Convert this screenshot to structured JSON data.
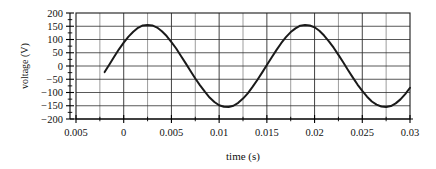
{
  "chart_data": {
    "type": "line",
    "title": "",
    "xlabel": "time (s)",
    "ylabel": "voltage (V)",
    "xlim": [
      -0.005,
      0.03
    ],
    "ylim": [
      -200,
      200
    ],
    "grid": true,
    "legend": "none",
    "line_color": "#1a1a1a",
    "grid_color": "#333333",
    "minor_grid_color": "#555555",
    "axis_color": "#000000",
    "background_color": "#ffffff",
    "xticks": [
      -0.005,
      0,
      0.005,
      0.01,
      0.015,
      0.02,
      0.025,
      0.03
    ],
    "xtick_labels": [
      "0.005",
      "0",
      "0.005",
      "0.01",
      "0.015",
      "0.02",
      "0.025",
      "0.03"
    ],
    "x_minor_step": 0.0025,
    "yticks": [
      -200,
      -150,
      -100,
      -50,
      0,
      50,
      100,
      150,
      200
    ],
    "ytick_labels": [
      "−200",
      "−150",
      "−100",
      "−50",
      "0",
      "50",
      "100",
      "150",
      "200"
    ],
    "y_minor_step": 25,
    "series": [
      {
        "name": "voltage",
        "form": "sine",
        "amplitude": 155,
        "period": 0.0165,
        "phase_zero_rising": -0.0016,
        "x_start": -0.002,
        "x_end": 0.03,
        "x": [
          -0.002,
          -0.0015,
          -0.001,
          -0.0005,
          0.0,
          0.0005,
          0.001,
          0.0015,
          0.002,
          0.0025,
          0.003,
          0.0035,
          0.004,
          0.0045,
          0.005,
          0.0055,
          0.006,
          0.0065,
          0.007,
          0.0075,
          0.008,
          0.0085,
          0.009,
          0.0095,
          0.01,
          0.0105,
          0.011,
          0.0115,
          0.012,
          0.0125,
          0.013,
          0.0135,
          0.014,
          0.0145,
          0.015,
          0.0155,
          0.016,
          0.0165,
          0.017,
          0.0175,
          0.018,
          0.0185,
          0.019,
          0.0195,
          0.02,
          0.0205,
          0.021,
          0.0215,
          0.022,
          0.0225,
          0.023,
          0.0235,
          0.024,
          0.0245,
          0.025,
          0.0255,
          0.026,
          0.0265,
          0.027,
          0.0275,
          0.028,
          0.0285,
          0.029,
          0.0295,
          0.03
        ],
        "y": [
          -23,
          6,
          35,
          63,
          88,
          111,
          129,
          144,
          153,
          155,
          153,
          145,
          131,
          113,
          90,
          66,
          38,
          10,
          -19,
          -47,
          -73,
          -97,
          -119,
          -136,
          -148,
          -154,
          -155,
          -150,
          -139,
          -123,
          -103,
          -79,
          -53,
          -25,
          4,
          32,
          60,
          86,
          109,
          128,
          142,
          152,
          155,
          153,
          146,
          133,
          115,
          93,
          69,
          42,
          14,
          -15,
          -43,
          -70,
          -94,
          -116,
          -134,
          -146,
          -153,
          -155,
          -151,
          -141,
          -126,
          -106,
          -82
        ]
      }
    ]
  },
  "figure": {
    "x_axis_title": "time (s)",
    "y_axis_title": "voltage (V)"
  }
}
